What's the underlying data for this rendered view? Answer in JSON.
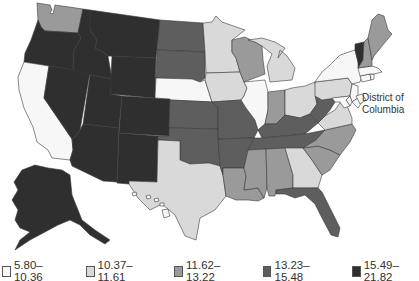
{
  "map": {
    "type": "choropleth",
    "region": "United States",
    "annotation": "District of Columbia"
  },
  "legend": {
    "classes": [
      {
        "label": "5.80–10.36",
        "color": "#f7f7f7"
      },
      {
        "label": "10.37–11.61",
        "color": "#d9d9d9"
      },
      {
        "label": "11.62–13.22",
        "color": "#9a9a9a"
      },
      {
        "label": "13.23–15.48",
        "color": "#5e5e5e"
      },
      {
        "label": "15.49–21.82",
        "color": "#2f2f2f"
      }
    ]
  },
  "states": {
    "WA": 3,
    "OR": 5,
    "CA": 1,
    "NV": 5,
    "ID": 5,
    "MT": 5,
    "WY": 5,
    "UT": 5,
    "AZ": 5,
    "CO": 5,
    "NM": 5,
    "ND": 4,
    "SD": 4,
    "NE": 1,
    "KS": 4,
    "OK": 4,
    "TX": 2,
    "MN": 2,
    "IA": 2,
    "MO": 4,
    "AR": 4,
    "LA": 3,
    "WI": 3,
    "IL": 1,
    "MI": 2,
    "IN": 3,
    "OH": 2,
    "KY": 4,
    "TN": 4,
    "MS": 3,
    "AL": 3,
    "WV": 4,
    "VA": 2,
    "NC": 3,
    "SC": 3,
    "GA": 2,
    "FL": 4,
    "PA": 2,
    "NY": 1,
    "VT": 5,
    "NH": 3,
    "ME": 3,
    "MA": 1,
    "CT": 1,
    "RI": 1,
    "NJ": 1,
    "DE": 1,
    "MD": 1,
    "DC": 1,
    "AK": 5,
    "HI": 1
  }
}
